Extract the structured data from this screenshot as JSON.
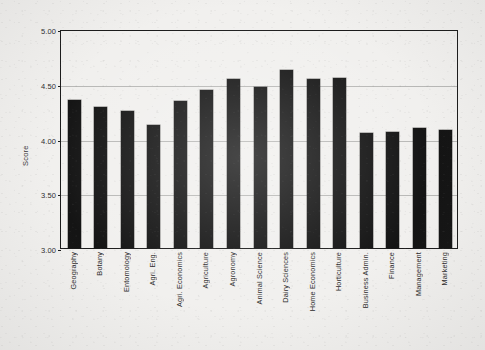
{
  "chart_data": {
    "type": "bar",
    "title": "",
    "xlabel": "",
    "ylabel": "Score",
    "ylim": [
      3.0,
      5.0
    ],
    "ytick_labels": [
      "5.00",
      "4.50",
      "4.00",
      "3.50",
      "3.00"
    ],
    "ytick_values": [
      5.0,
      4.5,
      4.0,
      3.5,
      3.0
    ],
    "grid": true,
    "legend": "none",
    "bar_color": "#141414",
    "categories": [
      "Geography",
      "Botany",
      "Entomology",
      "Agri. Eng.",
      "Agri. Economics",
      "Agriculture",
      "Agronomy",
      "Animal Science",
      "Dairy Sciences",
      "Home Economics",
      "Horticulture",
      "Business Admin.",
      "Finance",
      "Management",
      "Marketing"
    ],
    "values": [
      4.35,
      4.29,
      4.25,
      4.12,
      4.34,
      4.44,
      4.54,
      4.47,
      4.63,
      4.54,
      4.55,
      4.05,
      4.06,
      4.1,
      4.08
    ]
  }
}
